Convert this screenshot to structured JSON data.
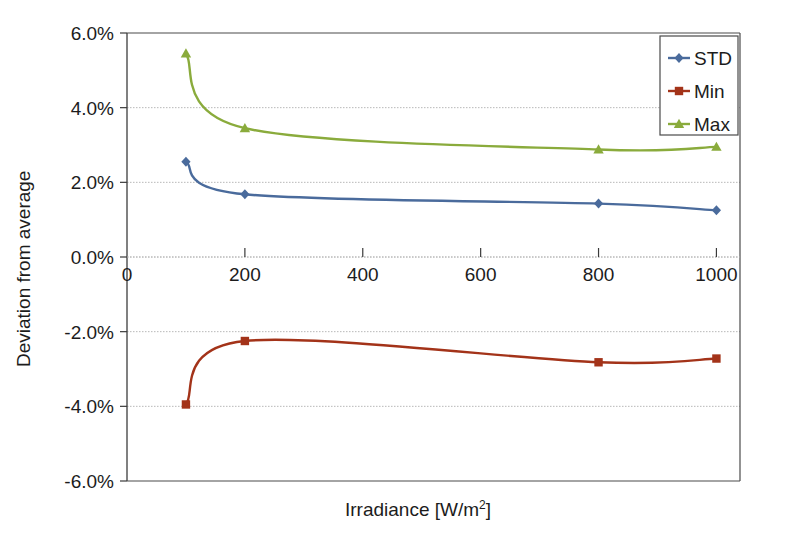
{
  "chart_data": {
    "type": "line",
    "title": "",
    "xlabel": "Irradiance [W/m2]",
    "xlabel_base": "Irradiance [W/m",
    "xlabel_sup": "2",
    "xlabel_tail": "]",
    "ylabel": "Deviation from average",
    "x": [
      100,
      200,
      800,
      1000
    ],
    "xlim": [
      0,
      1040
    ],
    "ylim": [
      -6.0,
      6.0
    ],
    "xticks": [
      0,
      200,
      400,
      600,
      800,
      1000
    ],
    "xtick_labels": [
      "0",
      "200",
      "400",
      "600",
      "800",
      "1000"
    ],
    "yticks": [
      6.0,
      4.0,
      2.0,
      0.0,
      -2.0,
      -4.0,
      -6.0
    ],
    "ytick_labels": [
      "6.0%",
      "4.0%",
      "2.0%",
      "0.0%",
      "-2.0%",
      "-4.0%",
      "-6.0%"
    ],
    "grid": true,
    "grid_axis": "y",
    "legend_position": "top-right",
    "smoothing": "spline",
    "units": "percent",
    "series": [
      {
        "name": "STD",
        "color": "#4a6b9c",
        "marker": "diamond",
        "values": [
          2.55,
          1.68,
          1.43,
          1.25
        ]
      },
      {
        "name": "Min",
        "color": "#a33319",
        "marker": "square",
        "values": [
          -3.95,
          -2.25,
          -2.82,
          -2.72
        ]
      },
      {
        "name": "Max",
        "color": "#8aab3c",
        "marker": "triangle",
        "values": [
          5.45,
          3.45,
          2.88,
          2.95
        ]
      }
    ]
  },
  "legend": {
    "items": [
      {
        "label": "STD",
        "color": "#4a6b9c",
        "marker": "diamond"
      },
      {
        "label": "Min",
        "color": "#a33319",
        "marker": "square"
      },
      {
        "label": "Max",
        "color": "#8aab3c",
        "marker": "triangle"
      }
    ]
  },
  "axes": {
    "y_title": "Deviation from average",
    "x_title_base": "Irradiance [W/m",
    "x_title_sup": "2",
    "x_title_tail": "]"
  },
  "colors": {
    "std": "#4a6b9c",
    "min": "#a33319",
    "max": "#8aab3c",
    "axis": "#3a3a3a",
    "grid": "#b8b8b8",
    "text": "#1c1c1c",
    "background": "#ffffff"
  }
}
